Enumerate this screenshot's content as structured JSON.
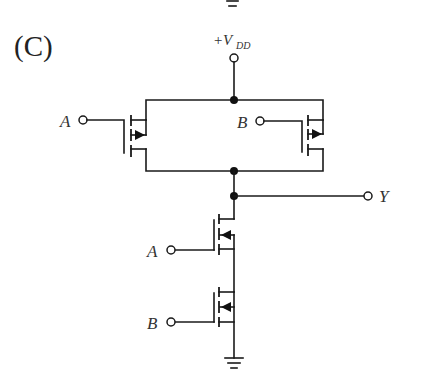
{
  "figure": {
    "panel_label": "(C)",
    "supply": {
      "prefix": "+V",
      "subscript": "DD"
    },
    "inputs": {
      "a_label": "A",
      "b_label": "B"
    },
    "output": {
      "label": "Y"
    }
  },
  "components": [
    {
      "id": "pmos-a",
      "type": "PMOS",
      "gate": "A",
      "connection": "parallel pull-up"
    },
    {
      "id": "pmos-b",
      "type": "PMOS",
      "gate": "B",
      "connection": "parallel pull-up"
    },
    {
      "id": "nmos-a",
      "type": "NMOS",
      "gate": "A",
      "connection": "series pull-down (top)"
    },
    {
      "id": "nmos-b",
      "type": "NMOS",
      "gate": "B",
      "connection": "series pull-down (bottom)"
    }
  ],
  "colors": {
    "ink": "#1a1a1a",
    "background": "#ffffff"
  }
}
